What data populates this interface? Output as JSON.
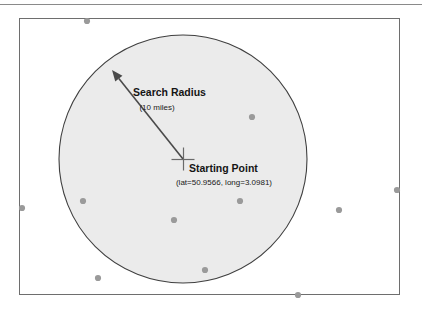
{
  "diagram": {
    "title_hidden": "",
    "frame": {
      "outer_rule_color": "#8a8a8a",
      "inner_rect_color": "#6e6e6e"
    },
    "circle": {
      "fill_color": "#ebebeb",
      "stroke_color": "#3f3f3f",
      "center_x": 183,
      "center_y": 159,
      "radius": 124
    },
    "radius_annotation": {
      "label": "Search Radius",
      "sublabel": "(10 miles)",
      "arrow_color": "#4a4a4a",
      "from_x": 183,
      "from_y": 159,
      "to_x": 112,
      "to_y": 70
    },
    "starting_point": {
      "label": "Starting Point",
      "coordinates": "(lat=50.9566, long=3.0981)",
      "marker_color": "#6a6a6a",
      "x": 183,
      "y": 159
    },
    "scatter_points": {
      "color": "#9a9a9a",
      "points": [
        {
          "x": 87,
          "y": 21
        },
        {
          "x": 252,
          "y": 117
        },
        {
          "x": 22,
          "y": 208
        },
        {
          "x": 83,
          "y": 201
        },
        {
          "x": 174,
          "y": 220
        },
        {
          "x": 240,
          "y": 201
        },
        {
          "x": 339,
          "y": 210
        },
        {
          "x": 397,
          "y": 190
        },
        {
          "x": 98,
          "y": 278
        },
        {
          "x": 205,
          "y": 270
        },
        {
          "x": 298,
          "y": 295
        }
      ]
    }
  }
}
